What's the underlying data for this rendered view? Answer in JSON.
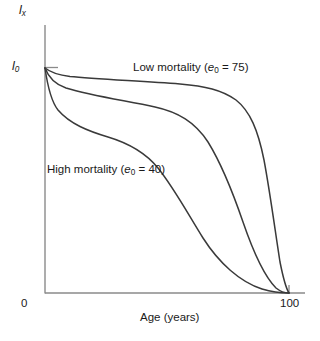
{
  "chart_data": {
    "type": "line",
    "title": "",
    "subtitle": "",
    "xlabel": "Age (years)",
    "ylabel": "lx",
    "ylabel_base": "l",
    "ylabel_sub": "x",
    "origin_label_base": "l",
    "origin_label_sub": "0",
    "xlim": [
      0,
      100
    ],
    "ylim": [
      0,
      1
    ],
    "xticks": [
      0,
      100
    ],
    "xtick_labels": [
      "0",
      "100"
    ],
    "yticks": [
      1
    ],
    "ytick_labels": [
      "l0"
    ],
    "grid": false,
    "legend_position": "inline-annotations",
    "annotations": [
      {
        "id": "low-mortality",
        "text": "Low mortality (e0 = 75)",
        "prefix": "Low mortality (",
        "symbol": "e",
        "subscript": "0",
        "suffix": " = 75)",
        "x": 48,
        "y": 0.93
      },
      {
        "id": "high-mortality",
        "text": "High mortality (e0 = 40)",
        "prefix": "High mortality (",
        "symbol": "e",
        "subscript": "0",
        "suffix": " = 40)",
        "x": 10,
        "y": 0.56
      }
    ],
    "series": [
      {
        "name": "Low mortality (e0 = 75)",
        "life_expectancy": 75,
        "color": "#3a3a3a",
        "x": [
          0,
          1,
          3,
          6,
          10,
          20,
          30,
          40,
          50,
          60,
          65,
          70,
          75,
          80,
          85,
          90,
          93,
          96,
          98,
          100
        ],
        "y": [
          1.0,
          0.985,
          0.978,
          0.974,
          0.97,
          0.96,
          0.95,
          0.94,
          0.925,
          0.9,
          0.885,
          0.86,
          0.82,
          0.73,
          0.58,
          0.36,
          0.22,
          0.1,
          0.04,
          0.0
        ],
        "path": "M45,68 C50,72 58,75 70,76.5 C95,79 140,81 180,84 C205,86 222,90 236,100 C250,111 258,130 264,160 C270,192 275,230 280,262 C284,282 287,290 289,293"
      },
      {
        "name": "Medium mortality",
        "life_expectancy": null,
        "color": "#3a3a3a",
        "x": [
          0,
          1,
          3,
          6,
          10,
          20,
          30,
          40,
          50,
          60,
          70,
          75,
          80,
          85,
          90,
          95,
          98,
          100
        ],
        "y": [
          1.0,
          0.93,
          0.91,
          0.9,
          0.895,
          0.885,
          0.87,
          0.855,
          0.83,
          0.79,
          0.71,
          0.63,
          0.51,
          0.37,
          0.22,
          0.09,
          0.025,
          0.0
        ],
        "path": "M45,68 C48,76 54,84 66,88 C92,96 128,101 155,107 C178,112 195,122 208,142 C221,163 232,190 243,222 C254,254 266,278 276,288 C281,292 286,293 289,293"
      },
      {
        "name": "High mortality (e0 = 40)",
        "life_expectancy": 40,
        "color": "#3a3a3a",
        "x": [
          0,
          1,
          2,
          4,
          8,
          15,
          25,
          35,
          45,
          55,
          65,
          72,
          80,
          86,
          92,
          96,
          98,
          100
        ],
        "y": [
          1.0,
          0.82,
          0.76,
          0.73,
          0.715,
          0.7,
          0.675,
          0.645,
          0.6,
          0.54,
          0.45,
          0.37,
          0.26,
          0.17,
          0.08,
          0.03,
          0.01,
          0.0
        ],
        "path": "M45,68 C47,82 50,100 58,110 C70,124 88,131 108,137 C128,143 145,152 158,168 C174,188 188,214 203,238 C219,263 240,282 262,289 C272,292 284,293 289,293"
      }
    ],
    "axes": {
      "x_axis_y_px": 293,
      "y_axis_x_px": 45,
      "x_start_px": 45,
      "x_end_px": 305,
      "y_top_px": 25,
      "axis_color": "#8a8a8a",
      "line_color": "#3a3a3a"
    }
  }
}
